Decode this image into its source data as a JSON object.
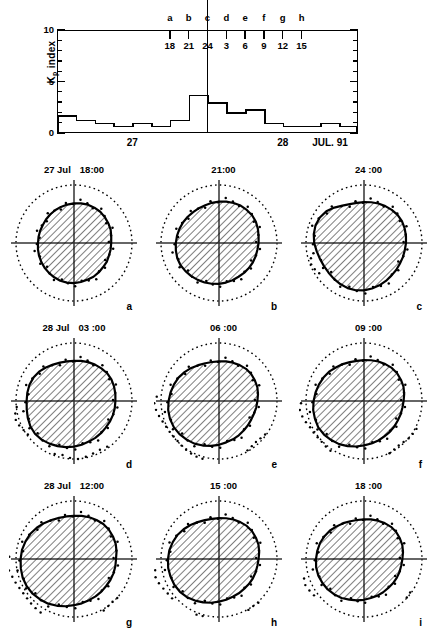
{
  "chart_data": {
    "type": "line",
    "title": "",
    "ylabel": "Kp index",
    "ylabel_base": "K",
    "ylabel_sub": "p",
    "ylabel_tail": " index",
    "ylim": [
      0,
      10
    ],
    "ytick_labels": [
      "10",
      "5",
      "0"
    ],
    "ytick_values": [
      10,
      5,
      0
    ],
    "grid": false,
    "xlabel": "",
    "x_day_labels": [
      "27",
      "28"
    ],
    "x_month_year": "JUL. 91",
    "x_unit": "3-hour Kp interval",
    "categories": [
      "00",
      "03",
      "06",
      "09",
      "12",
      "15",
      "18",
      "21",
      "00",
      "03",
      "06",
      "09",
      "12",
      "15",
      "18",
      "21"
    ],
    "series": [
      {
        "name": "Kp",
        "values": [
          1.7,
          1.3,
          1.0,
          0.7,
          1.0,
          0.7,
          1.3,
          3.7,
          3.0,
          2.0,
          2.3,
          1.0,
          0.7,
          0.7,
          1.0,
          0.7
        ]
      }
    ],
    "day_boundary_hour": "24",
    "markers": [
      {
        "letter": "a",
        "hour": "18"
      },
      {
        "letter": "b",
        "hour": "21"
      },
      {
        "letter": "c",
        "hour": "24"
      },
      {
        "letter": "d",
        "hour": "3"
      },
      {
        "letter": "e",
        "hour": "6"
      },
      {
        "letter": "f",
        "hour": "9"
      },
      {
        "letter": "g",
        "hour": "12"
      },
      {
        "letter": "h",
        "hour": "15"
      }
    ]
  },
  "panels": [
    {
      "letter": "a",
      "date": "27  Jul",
      "time": "18:00"
    },
    {
      "letter": "b",
      "date": "",
      "time": "21:00"
    },
    {
      "letter": "c",
      "date": "",
      "time": "24 :00"
    },
    {
      "letter": "d",
      "date": "28  Jul",
      "time": "03 :00"
    },
    {
      "letter": "e",
      "date": "",
      "time": "06 :00"
    },
    {
      "letter": "f",
      "date": "",
      "time": "09 :00"
    },
    {
      "letter": "g",
      "date": "28  Jul",
      "time": "12:00"
    },
    {
      "letter": "h",
      "date": "",
      "time": "15 :00"
    },
    {
      "letter": "i",
      "date": "",
      "time": "18 :00"
    }
  ],
  "colors": {
    "ink": "#000000",
    "background": "#ffffff"
  }
}
